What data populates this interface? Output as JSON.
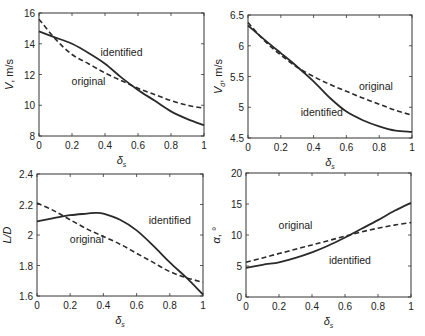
{
  "chart_data": [
    {
      "type": "line",
      "panel": "top-left",
      "xlabel": "δs",
      "ylabel": "V, m/s",
      "xlim": [
        0,
        1
      ],
      "ylim": [
        8,
        16
      ],
      "xticks": [
        "0",
        "0.2",
        "0.4",
        "0.6",
        "0.8",
        "1"
      ],
      "yticks": [
        "8",
        "10",
        "12",
        "14",
        "16"
      ],
      "x": [
        0,
        0.1,
        0.2,
        0.3,
        0.4,
        0.5,
        0.6,
        0.7,
        0.8,
        0.9,
        1.0
      ],
      "series": [
        {
          "name": "identified",
          "style": "solid",
          "values": [
            14.8,
            14.4,
            14.0,
            13.4,
            12.7,
            11.8,
            11.0,
            10.3,
            9.6,
            9.1,
            8.7
          ]
        },
        {
          "name": "original",
          "style": "dashed",
          "values": [
            15.6,
            14.3,
            13.3,
            12.7,
            12.1,
            11.6,
            11.1,
            10.7,
            10.3,
            10.0,
            9.8
          ]
        }
      ],
      "annotations": [
        {
          "text": "identified",
          "x": 0.5,
          "y": 13.2
        },
        {
          "text": "original",
          "x": 0.3,
          "y": 11.3
        }
      ],
      "grid": false
    },
    {
      "type": "line",
      "panel": "top-right",
      "xlabel": "δs",
      "ylabel": "Vd, m/s",
      "xlim": [
        0,
        1
      ],
      "ylim": [
        4.5,
        6.5
      ],
      "xticks": [
        "0",
        "0.2",
        "0.4",
        "0.6",
        "0.8",
        "1"
      ],
      "yticks": [
        "4.5",
        "5",
        "5.5",
        "6",
        "6.5"
      ],
      "x": [
        0,
        0.1,
        0.2,
        0.3,
        0.4,
        0.5,
        0.6,
        0.7,
        0.8,
        0.9,
        1.0
      ],
      "series": [
        {
          "name": "identified",
          "style": "solid",
          "values": [
            6.33,
            6.1,
            5.88,
            5.66,
            5.42,
            5.15,
            4.93,
            4.79,
            4.69,
            4.62,
            4.6
          ]
        },
        {
          "name": "original",
          "style": "dashed",
          "values": [
            6.38,
            6.08,
            5.85,
            5.65,
            5.5,
            5.37,
            5.26,
            5.15,
            5.05,
            4.95,
            4.87
          ]
        }
      ],
      "annotations": [
        {
          "text": "original",
          "x": 0.78,
          "y": 5.28
        },
        {
          "text": "identified",
          "x": 0.45,
          "y": 4.85
        }
      ],
      "grid": false
    },
    {
      "type": "line",
      "panel": "bottom-left",
      "xlabel": "δs",
      "ylabel": "L/D",
      "xlim": [
        0,
        1
      ],
      "ylim": [
        1.6,
        2.4
      ],
      "xticks": [
        "0",
        "0.2",
        "0.4",
        "0.6",
        "0.8",
        "1"
      ],
      "yticks": [
        "1.6",
        "1.8",
        "2",
        "2.2",
        "2.4"
      ],
      "x": [
        0,
        0.1,
        0.2,
        0.3,
        0.35,
        0.4,
        0.5,
        0.6,
        0.7,
        0.8,
        0.9,
        1.0
      ],
      "series": [
        {
          "name": "identified",
          "style": "solid",
          "values": [
            2.09,
            2.11,
            2.13,
            2.14,
            2.145,
            2.14,
            2.1,
            2.03,
            1.93,
            1.82,
            1.72,
            1.61
          ]
        },
        {
          "name": "original",
          "style": "dashed",
          "values": [
            2.21,
            2.16,
            2.1,
            2.04,
            2.015,
            1.99,
            1.94,
            1.88,
            1.82,
            1.76,
            1.72,
            1.69
          ]
        }
      ],
      "annotations": [
        {
          "text": "identified",
          "x": 0.8,
          "y": 2.07
        },
        {
          "text": "original",
          "x": 0.3,
          "y": 1.95
        }
      ],
      "grid": false
    },
    {
      "type": "line",
      "panel": "bottom-right",
      "xlabel": "δs",
      "ylabel": "α, °",
      "xlim": [
        0,
        1
      ],
      "ylim": [
        0,
        20
      ],
      "xticks": [
        "0",
        "0.2",
        "0.4",
        "0.6",
        "0.8",
        "1"
      ],
      "yticks": [
        "0",
        "5",
        "10",
        "15",
        "20"
      ],
      "x": [
        0,
        0.1,
        0.2,
        0.3,
        0.4,
        0.5,
        0.6,
        0.7,
        0.8,
        0.9,
        1.0
      ],
      "series": [
        {
          "name": "identified",
          "style": "solid",
          "values": [
            4.7,
            5.2,
            5.6,
            6.3,
            7.2,
            8.3,
            9.6,
            11.0,
            12.4,
            13.9,
            15.2
          ]
        },
        {
          "name": "original",
          "style": "dashed",
          "values": [
            5.6,
            6.3,
            7.0,
            7.7,
            8.4,
            9.1,
            9.8,
            10.5,
            11.1,
            11.6,
            12.0
          ]
        }
      ],
      "annotations": [
        {
          "text": "original",
          "x": 0.3,
          "y": 10.9
        },
        {
          "text": "identified",
          "x": 0.63,
          "y": 5.3
        }
      ],
      "grid": false
    }
  ]
}
